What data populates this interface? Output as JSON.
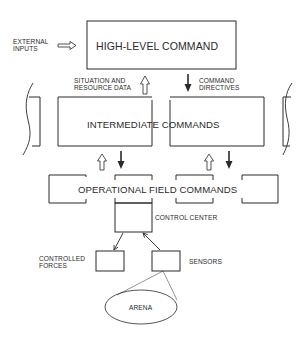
{
  "diagram": {
    "nodes": {
      "high_level": {
        "label": "HIGH-LEVEL COMMAND"
      },
      "intermediate": {
        "label": "INTERMEDIATE COMMANDS"
      },
      "operational": {
        "label": "OPERATIONAL FIELD COMMANDS"
      },
      "control_center": {
        "label": "CONTROL CENTER"
      },
      "controlled_forces": {
        "label_line1": "CONTROLLED",
        "label_line2": "FORCES"
      },
      "sensors": {
        "label": "SENSORS"
      },
      "arena": {
        "label": "ARENA"
      }
    },
    "edges": {
      "external_inputs": {
        "label_line1": "EXTERNAL",
        "label_line2": "INPUTS",
        "style": "hollow-arrow",
        "direction": "right"
      },
      "situation_data": {
        "label_line1": "SITUATION AND",
        "label_line2": "RESOURCE DATA",
        "style": "hollow-arrow",
        "direction": "up"
      },
      "command_directives": {
        "label_line1": "COMMAND",
        "label_line2": "DIRECTIVES",
        "style": "solid-arrow",
        "direction": "down"
      }
    },
    "colors": {
      "line": "#2a2a2a",
      "background": "#ffffff"
    }
  }
}
